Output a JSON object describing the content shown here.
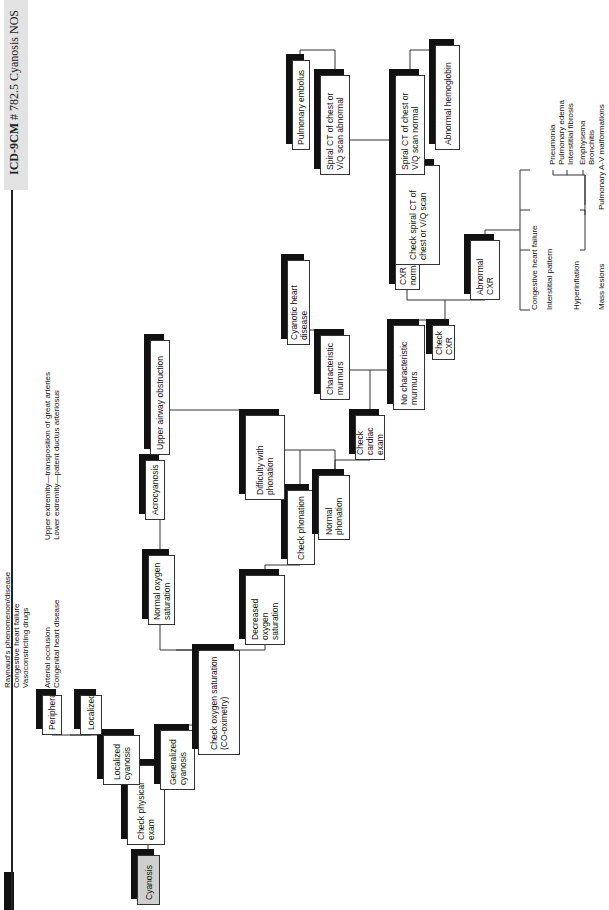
{
  "header": {
    "code_label": "ICD-9CM",
    "code_rest": "# 782.5 Cyanosis NOS"
  },
  "nodes": {
    "cyanosis": "Cyanosis",
    "check_physical_exam": "Check physical exam",
    "localized_cyanosis": "Localized cyanosis",
    "generalized_cyanosis": "Generalized cyanosis",
    "peripheral": "Peripheral",
    "localized": "Localized",
    "check_oxygen_saturation": "Check oxygen saturation (CO-oximetry)",
    "normal_oxygen_saturation": "Normal oxygen saturation",
    "acrocyanosis": "Acrocyanosis",
    "decreased_oxygen_saturation": "Decreased oxygen saturation",
    "check_phonation": "Check phonation",
    "difficulty_with_phonation": "Difficulty with phonation",
    "upper_airway_obstruction": "Upper airway obstruction",
    "normal_phonation": "Normal phonation",
    "check_cardiac_exam": "Check cardiac exam",
    "characteristic_murmurs": "Characteristic murmurs",
    "cyanotic_heart_disease": "Cyanotic heart disease",
    "no_characteristic_murmurs": "No characteristic murmurs",
    "check_cxr": "Check CXR",
    "cxr_normal": "CXR normal",
    "abnormal_cxr": "Abnormal CXR",
    "check_spiral_ct": "Check spiral CT of chest or V/Q scan",
    "pulmonary_embolus": "Pulmonary embolus",
    "spiral_ct_abnormal": "Spiral CT of chest or V/Q scan abnormal",
    "spiral_ct_normal": "Spiral CT of chest or V/Q scan normal",
    "abnormal_hemoglobin": "Abnormal hemoglobin"
  },
  "peripheral_causes": [
    "Raynaud's phenomenon/disease",
    "Congestive heart failure",
    "Vasoconstricting drugs"
  ],
  "localized_causes": [
    "Arterial occlusion",
    "Congenital heart disease"
  ],
  "congenital_subcauses": [
    "Upper extremity—transposition of great arteries",
    "Lower extremity—patent ductus arteriosus"
  ],
  "abnormal_cxr_findings": {
    "chf": "Congestive heart failure",
    "interstitial": "Interstitial pattern",
    "interstitial_items": [
      "Pneumonia",
      "Pulmonary edema",
      "Interstitial fibrosis"
    ],
    "hyperinflation": "Hyperinflation",
    "hyperinflation_items": [
      "Emphysema",
      "Bronchitis"
    ],
    "mass": "Mass lesions",
    "mass_item": "Pulmonary A-V malformations"
  }
}
